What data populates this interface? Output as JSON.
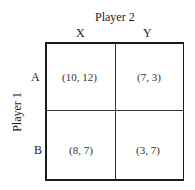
{
  "column_player": "Player 2",
  "row_player": "Player 1",
  "columns": [
    "X",
    "Y"
  ],
  "rows": [
    "A",
    "B"
  ],
  "payoffs": [
    [
      "(10, 12)",
      "(7, 3)"
    ],
    [
      "(8, 7)",
      "(3, 7)"
    ]
  ]
}
